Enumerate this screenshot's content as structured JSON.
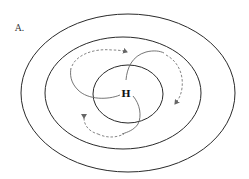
{
  "diagram": {
    "panel_label": "A.",
    "center_label": "H",
    "isobars": [
      {
        "name": "outer",
        "cx": 128,
        "cy": 93,
        "rx": 107,
        "ry": 79
      },
      {
        "name": "middle",
        "cx": 123,
        "cy": 93,
        "rx": 78,
        "ry": 56
      },
      {
        "name": "inner",
        "cx": 128,
        "cy": 94,
        "rx": 35,
        "ry": 29
      }
    ],
    "flows": [
      {
        "name": "upper-left-spiral",
        "direction": "outward clockwise"
      },
      {
        "name": "upper-right-spiral",
        "direction": "outward clockwise"
      },
      {
        "name": "lower-spiral",
        "direction": "outward clockwise"
      }
    ],
    "colors": {
      "isobar": "#2a2a2a",
      "flow": "#777777",
      "background": "#ffffff"
    }
  }
}
